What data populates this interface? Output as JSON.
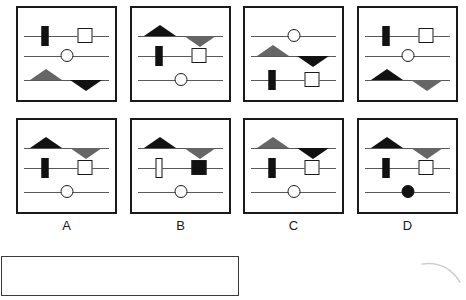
{
  "layout": {
    "panel_width": 101,
    "panel_height": 96,
    "top_row_y": 6,
    "bottom_row_y": 118,
    "panel_x": [
      16,
      130,
      243,
      357
    ],
    "row_offsets_pct": [
      30,
      52,
      78
    ]
  },
  "puzzle": {
    "type": "matrix-reasoning-slider-puzzle",
    "top_row": [
      {
        "name": "stimulus-panel-1",
        "rows": [
          {
            "shape": "bar",
            "fill": "black",
            "pos": 25
          },
          {
            "shape": "circle",
            "fill": "white",
            "pos": 50
          },
          {
            "shape": "triangle-up",
            "fill": "gray",
            "pos": 26
          }
        ],
        "rows_second": [
          {
            "shape": "square",
            "fill": "white",
            "pos": 72
          },
          {
            "shape": "none",
            "fill": "none",
            "pos": 0
          },
          {
            "shape": "triangle-down",
            "fill": "black",
            "pos": 73
          }
        ]
      },
      {
        "name": "stimulus-panel-2",
        "rows": [
          {
            "shape": "triangle-up",
            "fill": "black",
            "pos": 26
          },
          {
            "shape": "bar",
            "fill": "black",
            "pos": 25
          },
          {
            "shape": "circle",
            "fill": "white",
            "pos": 50
          }
        ],
        "rows_second": [
          {
            "shape": "triangle-down",
            "fill": "gray",
            "pos": 73
          },
          {
            "shape": "square",
            "fill": "white",
            "pos": 72
          },
          {
            "shape": "none",
            "fill": "none",
            "pos": 0
          }
        ]
      },
      {
        "name": "stimulus-panel-3",
        "rows": [
          {
            "shape": "circle",
            "fill": "white",
            "pos": 50
          },
          {
            "shape": "triangle-up",
            "fill": "gray",
            "pos": 26
          },
          {
            "shape": "bar",
            "fill": "black",
            "pos": 25
          }
        ],
        "rows_second": [
          {
            "shape": "none",
            "fill": "none",
            "pos": 0
          },
          {
            "shape": "triangle-down",
            "fill": "black",
            "pos": 73
          },
          {
            "shape": "square",
            "fill": "white",
            "pos": 72
          }
        ]
      },
      {
        "name": "stimulus-panel-4",
        "rows": [
          {
            "shape": "bar",
            "fill": "black",
            "pos": 25
          },
          {
            "shape": "circle",
            "fill": "white",
            "pos": 50
          },
          {
            "shape": "triangle-up",
            "fill": "black",
            "pos": 26
          }
        ],
        "rows_second": [
          {
            "shape": "square",
            "fill": "white",
            "pos": 72
          },
          {
            "shape": "none",
            "fill": "none",
            "pos": 0
          },
          {
            "shape": "triangle-down",
            "fill": "gray",
            "pos": 73
          }
        ]
      }
    ],
    "options": [
      {
        "letter": "A",
        "name": "option-panel-a",
        "rows": [
          {
            "shape": "triangle-up",
            "fill": "black",
            "pos": 26
          },
          {
            "shape": "bar",
            "fill": "black",
            "pos": 25
          },
          {
            "shape": "circle",
            "fill": "white",
            "pos": 50
          }
        ],
        "rows_second": [
          {
            "shape": "triangle-down",
            "fill": "gray",
            "pos": 73
          },
          {
            "shape": "square",
            "fill": "white",
            "pos": 72
          },
          {
            "shape": "none",
            "fill": "none",
            "pos": 0
          }
        ]
      },
      {
        "letter": "B",
        "name": "option-panel-b",
        "rows": [
          {
            "shape": "triangle-up",
            "fill": "black",
            "pos": 26
          },
          {
            "shape": "bar",
            "fill": "white",
            "pos": 25
          },
          {
            "shape": "circle",
            "fill": "white",
            "pos": 50
          }
        ],
        "rows_second": [
          {
            "shape": "triangle-down",
            "fill": "gray",
            "pos": 73
          },
          {
            "shape": "square",
            "fill": "black",
            "pos": 72
          },
          {
            "shape": "none",
            "fill": "none",
            "pos": 0
          }
        ]
      },
      {
        "letter": "C",
        "name": "option-panel-c",
        "rows": [
          {
            "shape": "triangle-up",
            "fill": "gray",
            "pos": 26
          },
          {
            "shape": "bar",
            "fill": "black",
            "pos": 25
          },
          {
            "shape": "circle",
            "fill": "white",
            "pos": 50
          }
        ],
        "rows_second": [
          {
            "shape": "triangle-down",
            "fill": "black",
            "pos": 73
          },
          {
            "shape": "square",
            "fill": "white",
            "pos": 72
          },
          {
            "shape": "none",
            "fill": "none",
            "pos": 0
          }
        ]
      },
      {
        "letter": "D",
        "name": "option-panel-d",
        "rows": [
          {
            "shape": "triangle-up",
            "fill": "black",
            "pos": 26
          },
          {
            "shape": "bar",
            "fill": "black",
            "pos": 25
          },
          {
            "shape": "circle",
            "fill": "black",
            "pos": 50
          }
        ],
        "rows_second": [
          {
            "shape": "triangle-down",
            "fill": "gray",
            "pos": 73
          },
          {
            "shape": "square",
            "fill": "white",
            "pos": 72
          },
          {
            "shape": "none",
            "fill": "none",
            "pos": 0
          }
        ]
      }
    ]
  },
  "answer_area": {
    "name": "answer-entry-box",
    "value": ""
  },
  "colors": {
    "ink": "#111111",
    "gray_fill": "#666666",
    "track": "#55585c",
    "border": "#1a1a1a",
    "faint_mark": "#cccccc"
  }
}
